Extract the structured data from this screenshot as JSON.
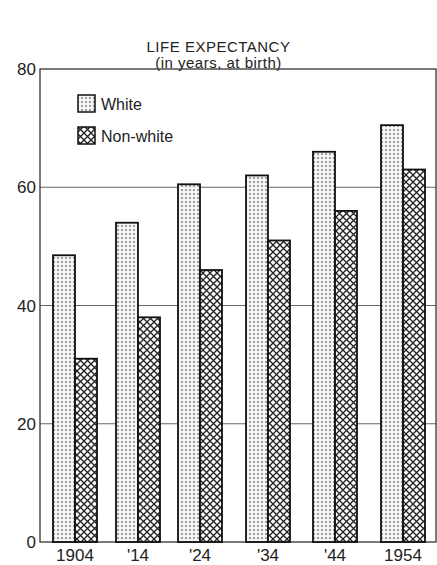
{
  "chart_data": {
    "type": "bar",
    "title": "LIFE EXPECTANCY",
    "subtitle": "(in years, at birth)",
    "xlabel": "",
    "ylabel": "",
    "ylim": [
      0,
      80
    ],
    "yticks": [
      0,
      20,
      40,
      60,
      80
    ],
    "categories": [
      "1904",
      "'14",
      "'24",
      "'34",
      "'44",
      "1954"
    ],
    "series": [
      {
        "name": "White",
        "pattern": "dots",
        "values": [
          48.5,
          54,
          60.5,
          62,
          66,
          70.5
        ]
      },
      {
        "name": "Non-white",
        "pattern": "crosshatch",
        "values": [
          31,
          38,
          46,
          51,
          56,
          63
        ]
      }
    ],
    "grid": "horizontal",
    "legend_position": "top-left inside"
  }
}
